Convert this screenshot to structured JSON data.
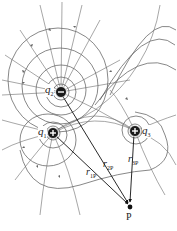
{
  "diagram": {
    "type": "electric-field-lines",
    "colors": {
      "field_line": "#6b6b6b",
      "equipotential": "#555555",
      "charge_fill": "#1a1a1a",
      "vector": "#111111"
    },
    "charges": [
      {
        "id": "q1",
        "label": "q",
        "sub": "1",
        "sign": "+",
        "x": 53,
        "y": 133
      },
      {
        "id": "q2",
        "label": "q",
        "sub": "2",
        "sign": "−",
        "x": 61,
        "y": 92
      },
      {
        "id": "q3",
        "label": "q",
        "sub": "3",
        "sign": "+",
        "x": 135,
        "y": 131
      }
    ],
    "point": {
      "label": "P",
      "x": 130,
      "y": 207
    },
    "vectors": [
      {
        "label": "r",
        "sub": "1P",
        "from": "q1"
      },
      {
        "label": "r",
        "sub": "2P",
        "from": "q2"
      },
      {
        "label": "r",
        "sub": "3P",
        "from": "q3"
      }
    ]
  }
}
